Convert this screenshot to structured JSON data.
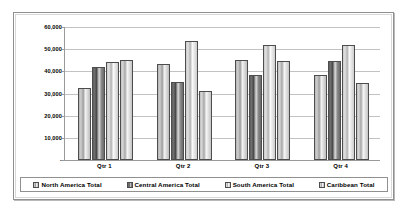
{
  "chart_data": {
    "type": "bar",
    "title": "",
    "subtitle": "",
    "xlabel": "",
    "ylabel": "",
    "categories": [
      "Qtr 1",
      "Qtr 2",
      "Qtr 3",
      "Qtr 4"
    ],
    "series": [
      {
        "name": "North America Total",
        "values": [
          32500,
          43500,
          45000,
          38500
        ]
      },
      {
        "name": "Central America Total",
        "values": [
          42000,
          35200,
          38200,
          44500
        ]
      },
      {
        "name": "South America Total",
        "values": [
          44000,
          53700,
          52000,
          52000
        ]
      },
      {
        "name": "Caribbean Total",
        "values": [
          45000,
          31200,
          44500,
          34700
        ]
      }
    ],
    "ylim": [
      0,
      60000
    ],
    "y_ticks": [
      60000,
      50000,
      40000,
      30000,
      20000,
      10000,
      0
    ],
    "y_tick_labels": [
      "60,000",
      "50,000",
      "40,000",
      "30,000",
      "20,000",
      "10,000",
      "-"
    ],
    "grid": true,
    "legend_position": "bottom",
    "colors": {
      "series_0": "#cfcfcf",
      "series_1": "#5d5d5d",
      "series_2": "#e2e2e2",
      "series_3": "#d8d8d8",
      "gridline": "#c2c2c2",
      "axis": "#9a9a9a",
      "frame_border": "#8f8f8f",
      "legend_border": "#909090",
      "bar_outline": "#4d4d4d",
      "text": "#000000",
      "background": "#ffffff"
    }
  },
  "legend": {
    "items": [
      {
        "label": "North America Total"
      },
      {
        "label": "Central America Total"
      },
      {
        "label": "South America Total"
      },
      {
        "label": "Caribbean Total"
      }
    ]
  }
}
